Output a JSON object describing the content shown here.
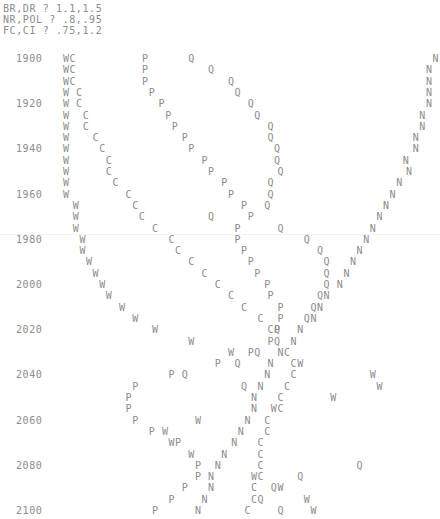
{
  "header": {
    "lines": [
      "BR,DR ? 1.1,1.5",
      "NR,POL ? .8,.95",
      "FC,CI ? .75,1.2"
    ]
  },
  "chart_data": {
    "type": "scatter",
    "title": "",
    "xlabel": "",
    "ylabel": "",
    "orientation": "character plot, time runs downward, value runs rightward",
    "y_axis_years": [
      1900,
      1920,
      1940,
      1960,
      1980,
      2000,
      2020,
      2040,
      2060,
      2080,
      2100
    ],
    "year_step": 5,
    "year_range": [
      1900,
      2100
    ],
    "value_axis": "print column (0-65)",
    "series": [
      {
        "name": "W",
        "values": [
          [
            1900,
            9
          ],
          [
            1905,
            9
          ],
          [
            1910,
            9
          ],
          [
            1915,
            9
          ],
          [
            1920,
            9
          ],
          [
            1925,
            9
          ],
          [
            1930,
            9
          ],
          [
            1935,
            9
          ],
          [
            1940,
            9
          ],
          [
            1945,
            9
          ],
          [
            1950,
            9
          ],
          [
            1955,
            9
          ],
          [
            1960,
            9
          ],
          [
            1965,
            10.5
          ],
          [
            1970,
            10.5
          ],
          [
            1975,
            10.5
          ],
          [
            1980,
            11.5
          ],
          [
            1985,
            11.5
          ],
          [
            1990,
            12.5
          ],
          [
            1995,
            13.5
          ],
          [
            2000,
            14.5
          ],
          [
            2005,
            15.5
          ],
          [
            2010,
            17.5
          ],
          [
            2015,
            19.5
          ],
          [
            2020,
            22.5
          ],
          [
            2025,
            28
          ],
          [
            2030,
            34
          ],
          [
            2035,
            44.5
          ],
          [
            2040,
            55.5
          ],
          [
            2045,
            56.5
          ],
          [
            2050,
            49.5
          ],
          [
            2055,
            40.5
          ],
          [
            2060,
            29
          ],
          [
            2065,
            24
          ],
          [
            2070,
            25
          ],
          [
            2075,
            28
          ],
          [
            2085,
            37.5
          ],
          [
            2090,
            41.5
          ],
          [
            2095,
            45.5
          ],
          [
            2100,
            46.5
          ]
        ]
      },
      {
        "name": "C",
        "values": [
          [
            1900,
            10
          ],
          [
            1905,
            10
          ],
          [
            1910,
            10
          ],
          [
            1915,
            11
          ],
          [
            1920,
            11
          ],
          [
            1925,
            12
          ],
          [
            1930,
            12
          ],
          [
            1935,
            13.5
          ],
          [
            1940,
            14.5
          ],
          [
            1945,
            15.5
          ],
          [
            1950,
            15.5
          ],
          [
            1955,
            16.5
          ],
          [
            1960,
            18.5
          ],
          [
            1965,
            19.5
          ],
          [
            1970,
            20.5
          ],
          [
            1975,
            22.5
          ],
          [
            1980,
            25
          ],
          [
            1985,
            26
          ],
          [
            1990,
            28
          ],
          [
            1995,
            30
          ],
          [
            2000,
            32
          ],
          [
            2005,
            34
          ],
          [
            2010,
            36
          ],
          [
            2015,
            38.5
          ],
          [
            2020,
            40
          ],
          [
            2030,
            42.5
          ],
          [
            2035,
            43.5
          ],
          [
            2040,
            43.5
          ],
          [
            2045,
            42.5
          ],
          [
            2050,
            41.5
          ],
          [
            2055,
            41.5
          ],
          [
            2060,
            39.5
          ],
          [
            2065,
            39.5
          ],
          [
            2070,
            38.5
          ],
          [
            2075,
            38.5
          ],
          [
            2080,
            38.5
          ],
          [
            2085,
            38.5
          ],
          [
            2090,
            37.5
          ],
          [
            2095,
            37.5
          ],
          [
            2100,
            36.5
          ]
        ]
      },
      {
        "name": "P",
        "values": [
          [
            1900,
            21
          ],
          [
            1905,
            21
          ],
          [
            1910,
            21
          ],
          [
            1915,
            22
          ],
          [
            1920,
            23.5
          ],
          [
            1925,
            24.5
          ],
          [
            1930,
            25.5
          ],
          [
            1935,
            27
          ],
          [
            1940,
            28
          ],
          [
            1945,
            30
          ],
          [
            1950,
            31
          ],
          [
            1955,
            33
          ],
          [
            1960,
            34
          ],
          [
            1965,
            36
          ],
          [
            1970,
            37
          ],
          [
            1975,
            35
          ],
          [
            1980,
            35
          ],
          [
            1985,
            36
          ],
          [
            1990,
            37
          ],
          [
            1995,
            38
          ],
          [
            2000,
            39.5
          ],
          [
            2005,
            40
          ],
          [
            2010,
            41.5
          ],
          [
            2015,
            41.5
          ],
          [
            2020,
            41
          ],
          [
            2025,
            40
          ],
          [
            2030,
            37
          ],
          [
            2035,
            32
          ],
          [
            2040,
            25
          ],
          [
            2045,
            19.5
          ],
          [
            2050,
            18.5
          ],
          [
            2055,
            18.5
          ],
          [
            2060,
            19.5
          ],
          [
            2065,
            22
          ],
          [
            2070,
            26
          ],
          [
            2080,
            29
          ],
          [
            2085,
            29
          ],
          [
            2090,
            27
          ],
          [
            2095,
            25
          ],
          [
            2100,
            22.5
          ]
        ]
      },
      {
        "name": "Q",
        "values": [
          [
            1900,
            28
          ],
          [
            1905,
            31
          ],
          [
            1910,
            34
          ],
          [
            1915,
            35
          ],
          [
            1920,
            37
          ],
          [
            1925,
            38
          ],
          [
            1930,
            40
          ],
          [
            1935,
            40
          ],
          [
            1940,
            41
          ],
          [
            1945,
            41
          ],
          [
            1950,
            41.5
          ],
          [
            1955,
            40
          ],
          [
            1960,
            40
          ],
          [
            1965,
            39.5
          ],
          [
            1970,
            31
          ],
          [
            1975,
            41.5
          ],
          [
            1980,
            45.5
          ],
          [
            1985,
            47.5
          ],
          [
            1990,
            48.5
          ],
          [
            1995,
            48.5
          ],
          [
            2000,
            48.5
          ],
          [
            2005,
            47.5
          ],
          [
            2010,
            46.5
          ],
          [
            2015,
            45.5
          ],
          [
            2020,
            41
          ],
          [
            2025,
            41
          ],
          [
            2030,
            38
          ],
          [
            2035,
            35
          ],
          [
            2040,
            27
          ],
          [
            2045,
            36
          ],
          [
            2080,
            53.5
          ],
          [
            2085,
            44.5
          ],
          [
            2090,
            40.5
          ],
          [
            2095,
            38.5
          ],
          [
            2100,
            41.5
          ]
        ]
      },
      {
        "name": "N",
        "values": [
          [
            1900,
            65
          ],
          [
            1905,
            64
          ],
          [
            1910,
            64
          ],
          [
            1915,
            64
          ],
          [
            1920,
            64
          ],
          [
            1925,
            63
          ],
          [
            1930,
            63
          ],
          [
            1935,
            62
          ],
          [
            1940,
            62
          ],
          [
            1945,
            60.5
          ],
          [
            1950,
            61
          ],
          [
            1955,
            59.5
          ],
          [
            1960,
            58.5
          ],
          [
            1965,
            57.5
          ],
          [
            1970,
            56.5
          ],
          [
            1975,
            55.5
          ],
          [
            1980,
            54.5
          ],
          [
            1985,
            53.5
          ],
          [
            1990,
            52.5
          ],
          [
            1995,
            51.5
          ],
          [
            2000,
            50.5
          ],
          [
            2005,
            48.5
          ],
          [
            2010,
            47.5
          ],
          [
            2015,
            46.5
          ],
          [
            2020,
            44.5
          ],
          [
            2025,
            43.5
          ],
          [
            2030,
            41.5
          ],
          [
            2035,
            40
          ],
          [
            2040,
            39.5
          ],
          [
            2045,
            38.5
          ],
          [
            2050,
            37.5
          ],
          [
            2055,
            37.5
          ],
          [
            2060,
            36.5
          ],
          [
            2065,
            35.5
          ],
          [
            2070,
            34.5
          ],
          [
            2075,
            33
          ],
          [
            2080,
            32
          ],
          [
            2085,
            31
          ],
          [
            2090,
            31
          ],
          [
            2095,
            30
          ],
          [
            2100,
            29
          ]
        ]
      }
    ]
  }
}
